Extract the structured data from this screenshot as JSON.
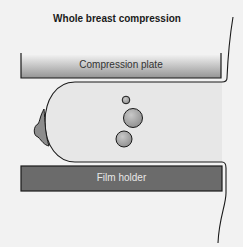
{
  "title": "Whole breast compression",
  "labels": {
    "compression_plate": "Compression plate",
    "film_holder": "Film holder"
  },
  "colors": {
    "background": "#f2f2f2",
    "breast_fill": "#e6e6e6",
    "outline": "#1a1a1a",
    "plate_top": "#f0f0f0",
    "plate_bottom": "#9a9a9a",
    "film_holder": "#6b6b6b",
    "nipple": "#8a8a8a",
    "lesion": "#a8a8a8"
  }
}
